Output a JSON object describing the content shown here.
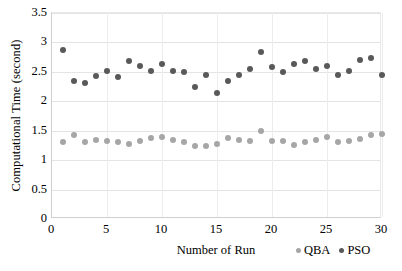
{
  "chart_data": {
    "type": "scatter",
    "title": "",
    "xlabel": "Number of Run",
    "ylabel": "Computational Time (second)",
    "xlim": [
      0,
      30
    ],
    "ylim": [
      0,
      3.5
    ],
    "xticks": [
      "0",
      "5",
      "10",
      "15",
      "20",
      "25",
      "30"
    ],
    "xtick_values": [
      0,
      5,
      10,
      15,
      20,
      25,
      30
    ],
    "yticks": [
      "0",
      "0.5",
      "1",
      "1.5",
      "2",
      "2.5",
      "3",
      "3.5"
    ],
    "ytick_values": [
      0,
      0.5,
      1,
      1.5,
      2,
      2.5,
      3,
      3.5
    ],
    "grid": true,
    "legend_position": "bottom-right",
    "x": [
      1,
      2,
      3,
      4,
      5,
      6,
      7,
      8,
      9,
      10,
      11,
      12,
      13,
      14,
      15,
      16,
      17,
      18,
      19,
      20,
      21,
      22,
      23,
      24,
      25,
      26,
      27,
      28,
      29,
      30
    ],
    "series": [
      {
        "name": "QBA",
        "color": "#a6a6a6",
        "values": [
          1.31,
          1.43,
          1.3,
          1.34,
          1.32,
          1.31,
          1.27,
          1.32,
          1.37,
          1.39,
          1.35,
          1.3,
          1.24,
          1.24,
          1.27,
          1.37,
          1.35,
          1.32,
          1.49,
          1.32,
          1.32,
          1.26,
          1.31,
          1.34,
          1.39,
          1.3,
          1.33,
          1.36,
          1.43,
          1.45
        ]
      },
      {
        "name": "PSO",
        "color": "#595959",
        "values": [
          2.87,
          2.35,
          2.31,
          2.43,
          2.52,
          2.42,
          2.68,
          2.6,
          2.52,
          2.63,
          2.52,
          2.5,
          2.24,
          2.45,
          2.14,
          2.34,
          2.45,
          2.55,
          2.83,
          2.58,
          2.49,
          2.63,
          2.68,
          2.55,
          2.6,
          2.44,
          2.52,
          2.7,
          2.74,
          2.44
        ]
      }
    ]
  },
  "legend": {
    "items": [
      {
        "label": "QBA"
      },
      {
        "label": "PSO"
      }
    ]
  }
}
